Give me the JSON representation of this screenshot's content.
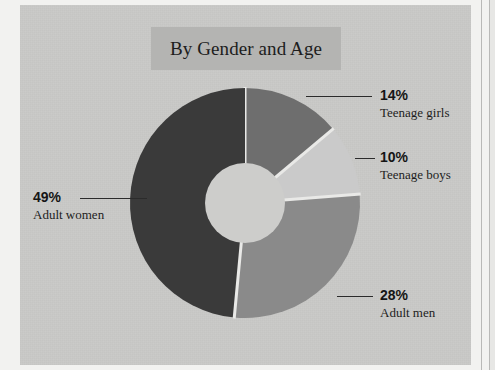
{
  "chart_data": {
    "type": "pie",
    "variant": "donut",
    "title": "By Gender and Age",
    "xlabel": "",
    "ylabel": "",
    "legend_position": "callout-labels",
    "grid": false,
    "units": "percent",
    "start_angle_deg": 0,
    "direction": "clockwise",
    "categories": [
      "Teenage girls",
      "Teenage boys",
      "Adult men",
      "Adult women"
    ],
    "values": [
      14,
      10,
      28,
      49
    ],
    "value_labels": [
      "14%",
      "10%",
      "28%",
      "49%"
    ],
    "colors": [
      "#6e6e6e",
      "#cacaca",
      "#8a8a8a",
      "#3a3a3a"
    ],
    "slices": [
      {
        "label": "Teenage girls",
        "value": 14,
        "value_label": "14%",
        "color": "#6e6e6e"
      },
      {
        "label": "Teenage boys",
        "value": 10,
        "value_label": "10%",
        "color": "#cacaca"
      },
      {
        "label": "Adult men",
        "value": 28,
        "value_label": "28%",
        "color": "#8a8a8a"
      },
      {
        "label": "Adult women",
        "value": 49,
        "value_label": "49%",
        "color": "#3a3a3a"
      }
    ]
  },
  "figure": {
    "title": "By Gender and Age",
    "background_color": "#c9c9c7",
    "title_band_color": "#b4b4b2",
    "separator_color": "#e9e9e7",
    "hole_color": "#cdcdcb"
  },
  "callouts": {
    "girls": {
      "pct": "14%",
      "cat": "Teenage girls"
    },
    "boys": {
      "pct": "10%",
      "cat": "Teenage boys"
    },
    "men": {
      "pct": "28%",
      "cat": "Adult men"
    },
    "women": {
      "pct": "49%",
      "cat": "Adult women"
    }
  }
}
